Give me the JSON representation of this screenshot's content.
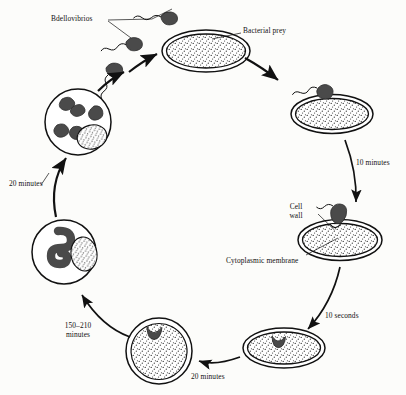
{
  "diagram": {
    "type": "circular-life-cycle",
    "direction": "clockwise",
    "style": {
      "background": "#fcfcfa",
      "ink": "#111111",
      "predator_fill": "#4a4a4a",
      "stipple": "#2b2b2b",
      "cell_fill": "#ffffff"
    }
  },
  "labels": {
    "bdellovibrios": "Bdellovibrios",
    "bacterial_prey": "Bacterial prey",
    "cell_wall": "Cell wall",
    "cytoplasmic_membrane": "Cytoplasmic membrane"
  },
  "timings": {
    "attachment_to_penetration": "10 minutes",
    "penetration_to_bdelloplast": "10 seconds",
    "bdelloplast_round": "20 minutes",
    "growth_filament": "150–210 minutes",
    "release": "20 minutes"
  },
  "stages": [
    {
      "id": "free-swimming-bdellovibrios",
      "name": "Free-swimming Bdellovibrios",
      "label": "Bdellovibrios",
      "count": 3,
      "shape": "comma-vibrio-with-flagellum"
    },
    {
      "id": "bacterial-prey",
      "name": "Bacterial prey cell",
      "label": "Bacterial prey",
      "shape": "ellipse-double-wall-stippled"
    },
    {
      "id": "attachment",
      "name": "Bdellovibrio attached to prey",
      "label": "",
      "shape": "ellipse-with-attached-predator"
    },
    {
      "id": "penetration",
      "name": "Penetration of cell wall",
      "label": "",
      "annotations": [
        "Cell wall",
        "Cytoplasmic membrane"
      ],
      "shape": "ellipse-predator-entering"
    },
    {
      "id": "periplasm-entry",
      "name": "Bdellovibrio in periplasmic space",
      "label": "",
      "shape": "ellipse-predator-inside-periplasm"
    },
    {
      "id": "bdelloplast",
      "name": "Rounded bdelloplast",
      "label": "",
      "shape": "circle-rounded-host-with-predator"
    },
    {
      "id": "filamentous-growth",
      "name": "Coiled filamentous growth",
      "label": "",
      "shape": "circle-with-coiled-filament-and-remnant"
    },
    {
      "id": "lysis-release",
      "name": "Lysis and release of progeny",
      "label": "",
      "shape": "circle-with-progeny-cells-and-remnant"
    }
  ]
}
